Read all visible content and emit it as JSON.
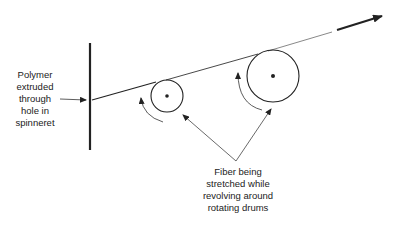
{
  "labels": {
    "spinneret": {
      "lines": [
        "Polymer",
        "extruded",
        "through",
        "hole in",
        "spinneret"
      ]
    },
    "drums": {
      "lines": [
        "Fiber being",
        "stretched while",
        "revolving around",
        "rotating drums"
      ]
    }
  },
  "elements": {
    "spinneret_plate": "vertical-plate",
    "drum_small": "small-rotating-drum",
    "drum_large": "large-rotating-drum",
    "fiber": "fiber-line",
    "output_arrow": "direction-arrow"
  },
  "colors": {
    "line": "#222222",
    "background": "#ffffff"
  }
}
